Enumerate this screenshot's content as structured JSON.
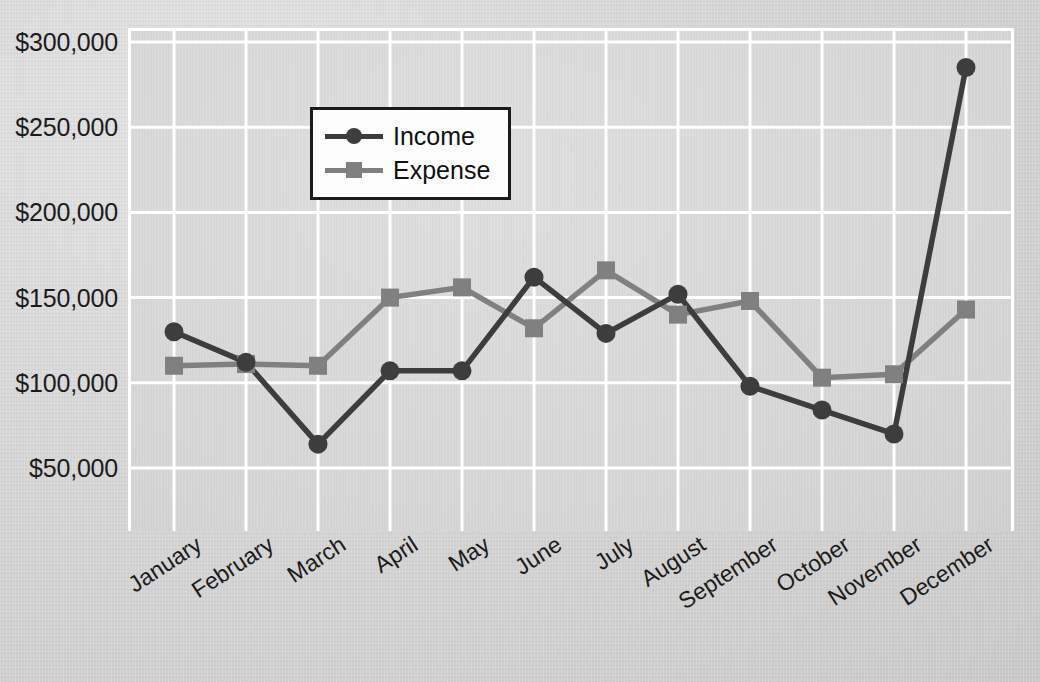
{
  "chart_data": {
    "type": "line",
    "title": "",
    "xlabel": "",
    "ylabel": "",
    "categories": [
      "January",
      "February",
      "March",
      "April",
      "May",
      "June",
      "July",
      "August",
      "September",
      "October",
      "November",
      "December"
    ],
    "series": [
      {
        "name": "Income",
        "color": "#3d3d3d",
        "marker": "circle",
        "values": [
          130000,
          112000,
          64000,
          107000,
          107000,
          162000,
          129000,
          152000,
          98000,
          84000,
          70000,
          285000
        ]
      },
      {
        "name": "Expense",
        "color": "#808080",
        "marker": "square",
        "values": [
          110000,
          111000,
          110000,
          150000,
          156000,
          132000,
          166000,
          140000,
          148000,
          103000,
          105000,
          143000
        ]
      }
    ],
    "ylim": [
      0,
      300000
    ],
    "yticks": [
      300000,
      250000,
      200000,
      150000,
      100000,
      50000
    ],
    "ytick_labels": [
      "$300,000",
      "$250,000",
      "$200,000",
      "$150,000",
      "$100,000",
      "$50,000"
    ],
    "grid": true,
    "legend_position": "upper-left"
  },
  "legend": {
    "items": [
      {
        "label": "Income"
      },
      {
        "label": "Expense"
      }
    ]
  },
  "colors": {
    "income": "#3d3d3d",
    "expense": "#808080",
    "grid": "#ffffff",
    "plot_background": "#d9d9d9",
    "page_background": "#d6d6d6",
    "text": "#1b1b1b"
  }
}
